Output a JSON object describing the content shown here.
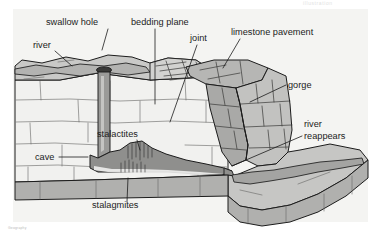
{
  "figure": {
    "caption_text": "Geography",
    "watermark_text": "illustration",
    "background_color": "#ffffff",
    "frame_color": "#f4f4f2",
    "outline_color": "#1c1c1c"
  },
  "palette": {
    "limestone_face": "#f1f1ef",
    "plateau_top": "#c9c9c7",
    "gorge_wall_shadow": "#a9a9a7",
    "gorge_wall_light": "#c2c2c0",
    "cave_fill": "#8f8f8d",
    "river_fill": "#9a9a98",
    "foreground_block_top": "#c6c6c4",
    "foreground_block_side": "#b0b0ae",
    "swallow_hole": "#3a3a38",
    "crack_line": "#6a6a68",
    "text_color": "#1c1c1c"
  },
  "labels": [
    {
      "id": "swallow-hole",
      "text": "swallow hole",
      "x": 46,
      "y": 25,
      "anchor": "start",
      "leader": "M 108 29 L 102 50"
    },
    {
      "id": "river",
      "text": "river",
      "x": 33,
      "y": 48,
      "anchor": "start",
      "leader": "M 55 51 L 72 66"
    },
    {
      "id": "bedding-plane",
      "text": "bedding plane",
      "x": 131,
      "y": 25,
      "anchor": "start",
      "leader": "M 155 29 L 155 104"
    },
    {
      "id": "joint",
      "text": "joint",
      "x": 190,
      "y": 41,
      "anchor": "start",
      "leader": "M 197 45 L 170 122"
    },
    {
      "id": "limestone-pavement",
      "text": "limestone pavement",
      "x": 231,
      "y": 35,
      "anchor": "start",
      "leader": "M 240 39 L 223 68"
    },
    {
      "id": "gorge",
      "text": "gorge",
      "x": 288,
      "y": 88,
      "anchor": "start",
      "leader": "M 286 85 L 250 102"
    },
    {
      "id": "river-reappears-1",
      "text": "river",
      "x": 304,
      "y": 127,
      "anchor": "start",
      "leader": ""
    },
    {
      "id": "river-reappears-2",
      "text": "reappears",
      "x": 304,
      "y": 139,
      "anchor": "start",
      "leader": "M 302 136 L 232 166"
    },
    {
      "id": "stalactites",
      "text": "stalactites",
      "x": 97,
      "y": 137,
      "anchor": "start",
      "leader": "M 137 140 L 140 150"
    },
    {
      "id": "cave",
      "text": "cave",
      "x": 35,
      "y": 160,
      "anchor": "start",
      "leader": "M 59 157 L 88 157"
    },
    {
      "id": "stalagmites",
      "text": "stalagmites",
      "x": 92,
      "y": 208,
      "anchor": "start",
      "leader": "M 127 202 L 128 178"
    }
  ],
  "features": {
    "swallow_hole_label": "swallow hole",
    "river_label": "river",
    "bedding_plane_label": "bedding plane",
    "joint_label": "joint",
    "limestone_pavement_label": "limestone pavement",
    "gorge_label": "gorge",
    "river_reappears_label": "river reappears",
    "stalactites_label": "stalactites",
    "cave_label": "cave",
    "stalagmites_label": "stalagmites"
  }
}
